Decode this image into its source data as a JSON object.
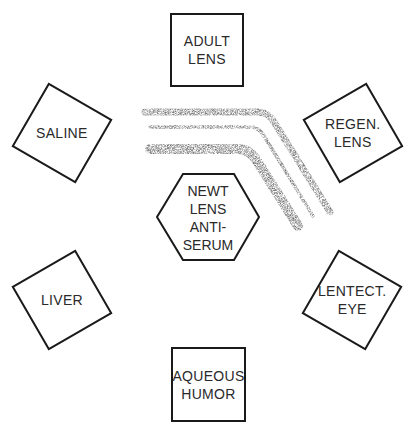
{
  "diagram": {
    "type": "immunodiffusion-plate",
    "center_well": {
      "label": "NEWT\nLENS\nANTI-\nSERUM",
      "shape": "hexagon"
    },
    "outer_wells": [
      {
        "id": "adult-lens",
        "label": "ADULT\nLENS",
        "position": "top"
      },
      {
        "id": "regen-lens",
        "label": "REGEN.\nLENS",
        "position": "top-right"
      },
      {
        "id": "lentect-eye",
        "label": "LENTECT.\nEYE",
        "position": "bottom-right"
      },
      {
        "id": "aqueous-humor",
        "label": "AQUEOUS\nHUMOR",
        "position": "bottom"
      },
      {
        "id": "liver",
        "label": "LIVER",
        "position": "bottom-left"
      },
      {
        "id": "saline",
        "label": "SALINE",
        "position": "top-left"
      }
    ],
    "precipitin_lines": 3,
    "colors": {
      "outline": "#1a1a1a",
      "text": "#2a2a2a",
      "precipitin": "#8a8a8a",
      "background": "#ffffff"
    }
  }
}
